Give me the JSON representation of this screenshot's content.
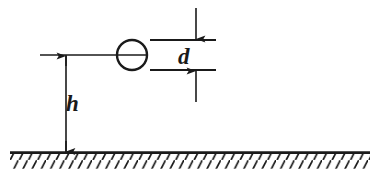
{
  "diagram": {
    "type": "engineering-schematic",
    "stroke_color": "#1a1a1a",
    "background_color": "#ffffff",
    "labels": {
      "diameter": "d",
      "height": "h"
    },
    "elements": {
      "body_shape": "circle",
      "ground_style": "hatched-line",
      "dimension_style": "arrow-terminated"
    },
    "geometry": {
      "circle_center_x": 132,
      "circle_center_y": 55,
      "circle_radius": 15,
      "ground_y": 152,
      "ground_x_start": 10,
      "ground_x_end": 370,
      "height_dim_x": 66,
      "diameter_dim_x": 196,
      "diameter_top_y": 40,
      "diameter_bottom_y": 70
    }
  }
}
